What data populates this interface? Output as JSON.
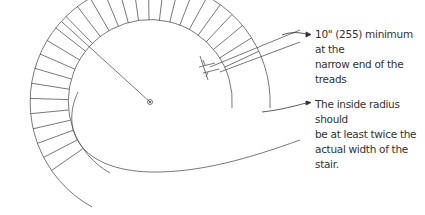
{
  "notes": [
    {
      "id": "narrow-end",
      "text_line1": "10\" (255) minimum at the",
      "text_line2": "narrow end of the treads"
    },
    {
      "id": "inside-radius",
      "text_line1": "The inside radius should",
      "text_line2": "be at least twice the",
      "text_line3": "actual width of the stair."
    }
  ],
  "diagram": {
    "center": [
      150,
      102
    ],
    "outer_radius": 118,
    "inner_radius": 78,
    "line_color": "#444444"
  }
}
